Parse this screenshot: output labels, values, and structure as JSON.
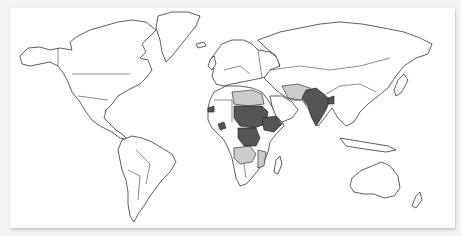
{
  "map": {
    "type": "choropleth",
    "projection": "equirectangular-like world",
    "colors": {
      "background": "#f4f4f4",
      "card": "#ffffff",
      "outline": "#1a1a1a",
      "no_data": "#ffffff",
      "level_high": "#555555",
      "level_low": "#cccccc"
    },
    "regions_high": [
      "India",
      "Pakistan",
      "Sudan",
      "South Sudan",
      "Chad",
      "Ethiopia",
      "Democratic Republic of the Congo",
      "Central African Republic",
      "Bangladesh",
      "Senegal",
      "Ivory Coast"
    ],
    "regions_low": [
      "Libya",
      "Egypt",
      "Iran",
      "Afghanistan",
      "Saudi Arabia (partial)",
      "Angola",
      "Zambia",
      "Mozambique",
      "Namibia",
      "Botswana"
    ]
  }
}
